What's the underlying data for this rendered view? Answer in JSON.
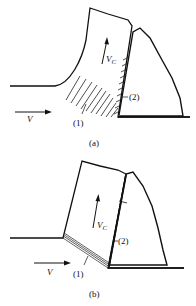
{
  "figure_a": {
    "label": "(a)",
    "velocity": "V",
    "chip_velocity": "V",
    "chip_velocity_sub": "C",
    "zone1": "(1)",
    "zone2": "(2)"
  },
  "figure_b": {
    "label": "(b)",
    "velocity": "V",
    "chip_velocity": "V",
    "chip_velocity_sub": "C",
    "zone1": "(1)",
    "zone2": "(2)"
  }
}
